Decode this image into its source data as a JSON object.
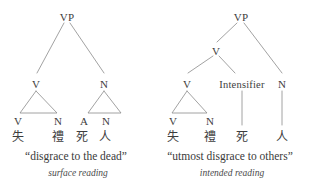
{
  "figure": {
    "type": "syntactic-tree-pair",
    "line_color": "#8a8a8a",
    "text_color": "#3d3d3d",
    "background": "#ffffff"
  },
  "trees": [
    {
      "id": "surface-reading-tree",
      "root_label": "VP",
      "gloss": "“disgrace to the dead”",
      "caption": "surface reading",
      "nodes": {
        "root": "VP",
        "left_branch": "V",
        "right_branch": "N",
        "leaf_1": "V",
        "leaf_2": "N",
        "leaf_3": "A",
        "leaf_4": "N"
      },
      "terminals": [
        {
          "label": "V",
          "han": "失"
        },
        {
          "label": "N",
          "han": "禮"
        },
        {
          "label": "A",
          "han": "死"
        },
        {
          "label": "N",
          "han": "人"
        }
      ]
    },
    {
      "id": "intended-reading-tree",
      "root_label": "VP",
      "gloss": "“utmost disgrace to others”",
      "caption": "intended reading",
      "nodes": {
        "root": "VP",
        "mid_v": "V",
        "leaf_1": "V",
        "leaf_2": "N",
        "intensifier": "Intensifier",
        "right_n": "N"
      },
      "terminals": [
        {
          "label": "V",
          "han": "失"
        },
        {
          "label": "N",
          "han": "禮"
        },
        {
          "label": "Intensifier",
          "han": "死"
        },
        {
          "label": "N",
          "han": "人"
        }
      ]
    }
  ]
}
